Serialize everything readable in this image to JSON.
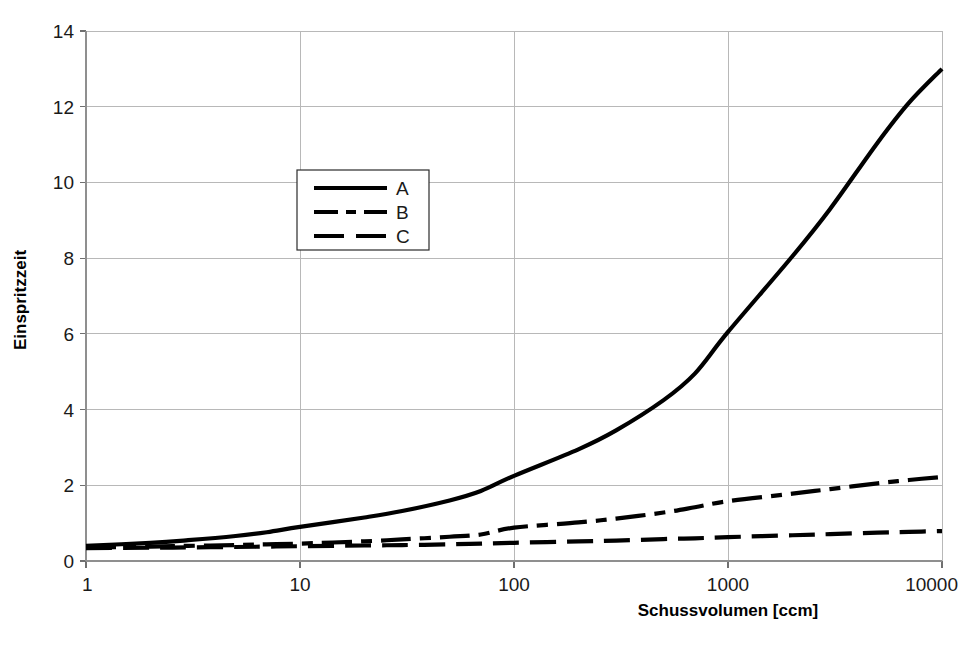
{
  "chart_data": {
    "type": "line",
    "title": "",
    "xlabel": "Schussvolumen [ccm]",
    "ylabel": "Einspritzzeit",
    "xscale": "log",
    "xlim": [
      1,
      10000
    ],
    "ylim": [
      0,
      14
    ],
    "grid": true,
    "legend_position": "upper-left-inside",
    "x_ticks": [
      "1",
      "10",
      "100",
      "1000",
      "10000"
    ],
    "x_tick_values": [
      1,
      10,
      100,
      1000,
      10000
    ],
    "y_ticks": [
      "0",
      "2",
      "4",
      "6",
      "8",
      "10",
      "12",
      "14"
    ],
    "y_tick_values": [
      0,
      2,
      4,
      6,
      8,
      10,
      12,
      14
    ],
    "x": [
      1,
      2,
      3,
      5,
      7,
      10,
      20,
      30,
      50,
      70,
      100,
      200,
      300,
      500,
      700,
      1000,
      2000,
      3000,
      5000,
      7000,
      10000
    ],
    "series": [
      {
        "name": "A",
        "style": "solid",
        "values": [
          0.4,
          0.48,
          0.55,
          0.66,
          0.76,
          0.9,
          1.15,
          1.32,
          1.6,
          1.85,
          2.25,
          2.95,
          3.45,
          4.25,
          4.95,
          6.05,
          8.05,
          9.3,
          11.05,
          12.1,
          13.0
        ]
      },
      {
        "name": "B",
        "style": "dash-dot",
        "values": [
          0.36,
          0.38,
          0.4,
          0.42,
          0.44,
          0.46,
          0.52,
          0.57,
          0.64,
          0.7,
          0.88,
          1.02,
          1.12,
          1.28,
          1.42,
          1.58,
          1.78,
          1.9,
          2.05,
          2.14,
          2.22
        ]
      },
      {
        "name": "C",
        "style": "dashed",
        "values": [
          0.34,
          0.35,
          0.36,
          0.37,
          0.38,
          0.39,
          0.41,
          0.42,
          0.44,
          0.46,
          0.48,
          0.52,
          0.54,
          0.58,
          0.6,
          0.63,
          0.68,
          0.71,
          0.75,
          0.77,
          0.79
        ]
      }
    ],
    "legend_entries": [
      {
        "label": "A",
        "style": "solid"
      },
      {
        "label": "B",
        "style": "dash-dot"
      },
      {
        "label": "C",
        "style": "dashed"
      }
    ],
    "colors": {
      "series": "#000000",
      "grid": "#b8b8b8",
      "axis": "#8f8f8f",
      "text": "#1a1a1a",
      "background": "#ffffff"
    }
  }
}
